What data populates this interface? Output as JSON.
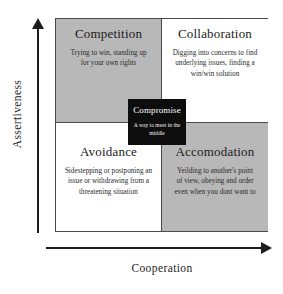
{
  "diagram": {
    "axes": {
      "y_label": "Assertiveness",
      "x_label": "Cooperation"
    },
    "colors": {
      "shaded_cell": "#b8b8b8",
      "plain_cell": "#ffffff",
      "center_box": "#0d0d0d",
      "border": "#4a4a4a",
      "text": "#1b1b1b"
    },
    "quadrants": [
      {
        "id": "competition",
        "title": "Competition",
        "description": "Trying to win, standing up for your own rights",
        "position": "top-left",
        "shaded": true
      },
      {
        "id": "collaboration",
        "title": "Collaboration",
        "description": "Digging into concerns to find underlying issues, finding a win/win solution",
        "position": "top-right",
        "shaded": false
      },
      {
        "id": "avoidance",
        "title": "Avoidance",
        "description": "Sidestepping or postponing an issue or withdrawing from a threatening situation",
        "position": "bottom-left",
        "shaded": false
      },
      {
        "id": "accomodation",
        "title": "Accomodation",
        "description": "Yeilding to another's point of view, obeying and order even when you dont want to",
        "position": "bottom-right",
        "shaded": true
      }
    ],
    "center": {
      "id": "compromise",
      "title": "Compromise",
      "description": "A way to meet in the middle"
    }
  }
}
